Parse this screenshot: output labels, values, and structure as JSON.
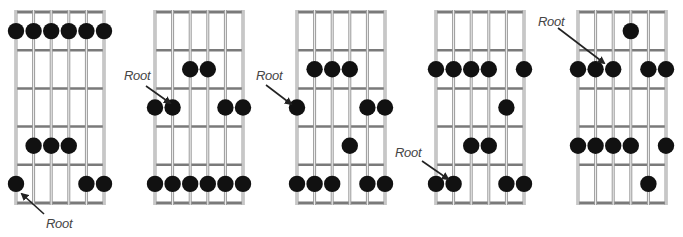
{
  "figure": {
    "title": "",
    "string_count": 6,
    "fret_rows": 5,
    "root_label": "Root",
    "colors": {
      "background": "#ffffff",
      "string": "#9a9a9a",
      "fret": "#7a7a7a",
      "dot": "#111111",
      "label": "#444444",
      "arrow": "#222222"
    }
  },
  "diagrams": [
    {
      "id": 1,
      "x0": 16,
      "dx": 17.6,
      "top": 12,
      "bottom": 203,
      "dots": [
        [
          0,
          1
        ],
        [
          1,
          1
        ],
        [
          2,
          1
        ],
        [
          3,
          1
        ],
        [
          4,
          1
        ],
        [
          5,
          1
        ],
        [
          1,
          4
        ],
        [
          2,
          4
        ],
        [
          3,
          4
        ],
        [
          0,
          5
        ],
        [
          4,
          5
        ],
        [
          5,
          5
        ]
      ],
      "root": [
        0,
        5
      ],
      "label": {
        "text": "Root",
        "x": 46,
        "y": 216
      },
      "arrow": {
        "x1": 44,
        "y1": 214,
        "x2": 22,
        "y2": 194
      }
    },
    {
      "id": 2,
      "x0": 155,
      "dx": 17.6,
      "top": 12,
      "bottom": 203,
      "dots": [
        [
          2,
          2
        ],
        [
          3,
          2
        ],
        [
          0,
          3
        ],
        [
          1,
          3
        ],
        [
          4,
          3
        ],
        [
          5,
          3
        ],
        [
          0,
          5
        ],
        [
          1,
          5
        ],
        [
          2,
          5
        ],
        [
          3,
          5
        ],
        [
          4,
          5
        ],
        [
          5,
          5
        ]
      ],
      "root": [
        1,
        3
      ],
      "label": {
        "text": "Root",
        "x": 124,
        "y": 68
      },
      "arrow": {
        "x1": 146,
        "y1": 86,
        "x2": 170,
        "y2": 103
      }
    },
    {
      "id": 3,
      "x0": 297,
      "dx": 17.6,
      "top": 12,
      "bottom": 203,
      "dots": [
        [
          1,
          2
        ],
        [
          2,
          2
        ],
        [
          3,
          2
        ],
        [
          0,
          3
        ],
        [
          4,
          3
        ],
        [
          5,
          3
        ],
        [
          3,
          4
        ],
        [
          0,
          5
        ],
        [
          1,
          5
        ],
        [
          2,
          5
        ],
        [
          4,
          5
        ],
        [
          5,
          5
        ]
      ],
      "root": [
        0,
        3
      ],
      "label": {
        "text": "Root",
        "x": 256,
        "y": 68
      },
      "arrow": {
        "x1": 266,
        "y1": 85,
        "x2": 291,
        "y2": 104
      }
    },
    {
      "id": 4,
      "x0": 436,
      "dx": 17.6,
      "top": 12,
      "bottom": 203,
      "dots": [
        [
          0,
          2
        ],
        [
          1,
          2
        ],
        [
          2,
          2
        ],
        [
          3,
          2
        ],
        [
          5,
          2
        ],
        [
          4,
          3
        ],
        [
          2,
          4
        ],
        [
          3,
          4
        ],
        [
          0,
          5
        ],
        [
          1,
          5
        ],
        [
          4,
          5
        ],
        [
          5,
          5
        ]
      ],
      "root": [
        1,
        5
      ],
      "label": {
        "text": "Root",
        "x": 395,
        "y": 145
      },
      "arrow": {
        "x1": 422,
        "y1": 161,
        "x2": 448,
        "y2": 179
      }
    },
    {
      "id": 5,
      "x0": 578,
      "dx": 17.6,
      "top": 12,
      "bottom": 203,
      "dots": [
        [
          3,
          1
        ],
        [
          0,
          2
        ],
        [
          1,
          2
        ],
        [
          2,
          2
        ],
        [
          4,
          2
        ],
        [
          5,
          2
        ],
        [
          0,
          4
        ],
        [
          1,
          4
        ],
        [
          2,
          4
        ],
        [
          3,
          4
        ],
        [
          5,
          4
        ],
        [
          4,
          5
        ]
      ],
      "root": [
        2,
        2
      ],
      "label": {
        "text": "Root",
        "x": 538,
        "y": 14
      },
      "arrow": {
        "x1": 558,
        "y1": 28,
        "x2": 604,
        "y2": 63
      }
    }
  ]
}
